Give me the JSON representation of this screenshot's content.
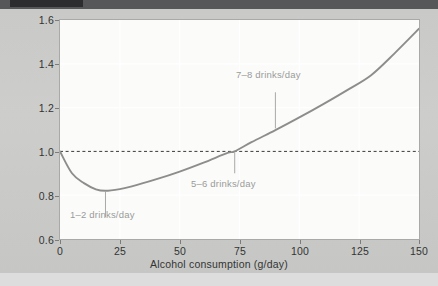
{
  "chart_data": {
    "type": "line",
    "title": "",
    "xlabel": "Alcohol consumption (g/day)",
    "ylabel": "Relative risk",
    "xlim": [
      0,
      150
    ],
    "ylim": [
      0.6,
      1.6
    ],
    "xticks": [
      "0",
      "25",
      "50",
      "75",
      "100",
      "125",
      "150"
    ],
    "yticks": [
      "0.6",
      "0.8",
      "1.0",
      "1.2",
      "1.4",
      "1.6"
    ],
    "grid": "faint white gridlines at major ticks",
    "legend": "none",
    "reference_line": {
      "label": "Relative risk = 1.0",
      "y": 1.0,
      "style": "dashed"
    },
    "series": [
      {
        "name": "Relative risk",
        "color": "#8d8e8c",
        "x": [
          0,
          5,
          10,
          15,
          19,
          25,
          30,
          40,
          50,
          60,
          70,
          73,
          80,
          90,
          100,
          110,
          120,
          130,
          140,
          150
        ],
        "y": [
          1.0,
          0.9,
          0.855,
          0.827,
          0.82,
          0.828,
          0.84,
          0.872,
          0.908,
          0.949,
          0.993,
          1.0,
          1.042,
          1.097,
          1.155,
          1.216,
          1.28,
          1.348,
          1.45,
          1.56
        ]
      }
    ],
    "annotations": [
      {
        "text": "1–2 drinks/day",
        "x": 19,
        "y": 0.82,
        "note": "points to curve minimum"
      },
      {
        "text": "5–6 drinks/day",
        "x": 73,
        "y": 1.0,
        "note": "points to where curve crosses relative risk of 1.0"
      },
      {
        "text": "7–8 drinks/day",
        "x": 90,
        "y": 1.1,
        "note": "points to curve on rising limb"
      }
    ]
  },
  "axis": {
    "y_label": "Relative risk",
    "x_label": "Alcohol consumption (g/day)",
    "y_ticks": [
      "1.6",
      "1.4",
      "1.2",
      "1.0",
      "0.8",
      "0.6"
    ],
    "x_ticks": [
      "0",
      "25",
      "50",
      "75",
      "100",
      "125",
      "150"
    ]
  },
  "annotations": {
    "low": "1–2 drinks/day",
    "mid": "5–6 drinks/day",
    "high": "7–8 drinks/day"
  },
  "colors": {
    "curve": "#8d8e8c",
    "reference_line": "#3a3b39",
    "page_background": "#c9cac8",
    "plot_background": "#fbfbfa",
    "annotation_text": "#9a9b99",
    "axis_text": "#333433"
  }
}
